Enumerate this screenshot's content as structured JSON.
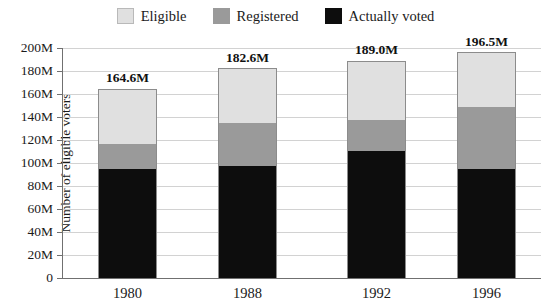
{
  "chart_data": {
    "type": "bar",
    "subtype": "stacked-bar",
    "title": "",
    "xlabel": "",
    "ylabel": "Number of eligible voters",
    "categories": [
      "1980",
      "1988",
      "1992",
      "1996"
    ],
    "ylim": [
      0,
      200
    ],
    "yunit": "M",
    "ytick_labels": [
      "200M",
      "180M",
      "160M",
      "140M",
      "120M",
      "100M",
      "80M",
      "60M",
      "40M",
      "20M",
      "0"
    ],
    "ytick_values": [
      200,
      180,
      160,
      140,
      120,
      100,
      80,
      60,
      40,
      20,
      0
    ],
    "grid": true,
    "legend_position": "top-center",
    "series": [
      {
        "name": "Eligible",
        "color": "#e0e0e0",
        "values": [
          164.6,
          182.6,
          189.0,
          196.5
        ],
        "note": "cumulative top of stack (total eligible)"
      },
      {
        "name": "Registered",
        "color": "#9a9a9a",
        "values": [
          117.0,
          136.0,
          138.0,
          150.0
        ],
        "note": "cumulative top of registered segment"
      },
      {
        "name": "Actually voted",
        "color": "#0d0d0d",
        "values": [
          96.0,
          98.0,
          111.0,
          96.0
        ],
        "note": "cumulative top of actually-voted segment"
      }
    ],
    "bar_labels": [
      "164.6M",
      "182.6M",
      "189.0M",
      "196.5M"
    ],
    "bars": [
      {
        "category": "1980",
        "total_label": "164.6M",
        "eligible_top": 164.6,
        "registered_top": 117.0,
        "voted_top": 96.0
      },
      {
        "category": "1988",
        "total_label": "182.6M",
        "eligible_top": 182.6,
        "registered_top": 136.0,
        "voted_top": 98.0
      },
      {
        "category": "1992",
        "total_label": "189.0M",
        "eligible_top": 189.0,
        "registered_top": 138.0,
        "voted_top": 111.0
      },
      {
        "category": "1996",
        "total_label": "196.5M",
        "eligible_top": 196.5,
        "registered_top": 150.0,
        "voted_top": 96.0
      }
    ]
  },
  "legend": {
    "items": [
      {
        "label": "Eligible",
        "color": "#e0e0e0",
        "swatch_name": "legend-swatch-eligible"
      },
      {
        "label": "Registered",
        "color": "#9a9a9a",
        "swatch_name": "legend-swatch-registered"
      },
      {
        "label": "Actually voted",
        "color": "#0d0d0d",
        "swatch_name": "legend-swatch-actually-voted"
      }
    ]
  },
  "axes": {
    "y_title": "Number of eligible voters",
    "y_ticks": [
      "200M",
      "180M",
      "160M",
      "140M",
      "120M",
      "100M",
      "80M",
      "60M",
      "40M",
      "20M",
      "0"
    ],
    "x_ticks": [
      "1980",
      "1988",
      "1992",
      "1996"
    ]
  },
  "colors": {
    "eligible": "#e0e0e0",
    "registered": "#9a9a9a",
    "voted": "#0d0d0d",
    "grid": "#d2d2d2",
    "axis": "#707070",
    "background": "#ffffff",
    "text": "#1a1a1a"
  }
}
